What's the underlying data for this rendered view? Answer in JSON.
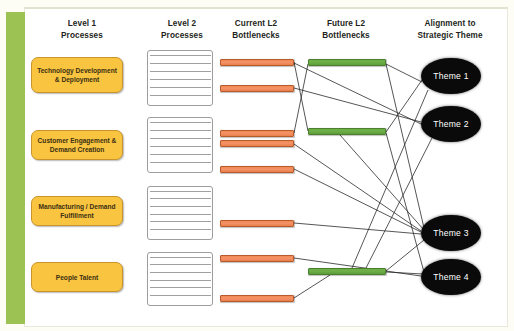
{
  "diagram": {
    "columns": [
      {
        "id": "level1",
        "line1": "Level 1",
        "line2": "Processes",
        "x": 82,
        "y": 18
      },
      {
        "id": "level2",
        "line1": "Level 2",
        "line2": "Processes",
        "x": 182,
        "y": 18
      },
      {
        "id": "current_l2_bottlenecks",
        "line1": "Current L2",
        "line2": "Bottlenecks",
        "x": 256,
        "y": 18
      },
      {
        "id": "future_l2_bottlenecks",
        "line1": "Future L2",
        "line2": "Bottlenecks",
        "x": 346,
        "y": 18
      },
      {
        "id": "alignment",
        "line1": "Alignment to",
        "line2": "Strategic Theme",
        "x": 450,
        "y": 18
      }
    ],
    "level1_processes": [
      {
        "id": "technology",
        "label": "Technology Development & Deployment",
        "x": 31,
        "y": 57,
        "w": 92,
        "h": 36
      },
      {
        "id": "customer",
        "label": "Customer Engagement & Demand Creation",
        "x": 31,
        "y": 130,
        "w": 92,
        "h": 30
      },
      {
        "id": "manufacturing",
        "label": "Manufacturing / Demand Fulfillment",
        "x": 31,
        "y": 196,
        "w": 92,
        "h": 30
      },
      {
        "id": "people",
        "label": "People Talent",
        "x": 31,
        "y": 262,
        "w": 92,
        "h": 30
      }
    ],
    "level2_stacks": [
      {
        "id": "stack-technology",
        "rows": 7,
        "x": 147,
        "y": 50,
        "w": 66,
        "h": 56
      },
      {
        "id": "stack-customer",
        "rows": 7,
        "x": 147,
        "y": 117,
        "w": 66,
        "h": 56
      },
      {
        "id": "stack-manufacturing",
        "rows": 7,
        "x": 147,
        "y": 186,
        "w": 66,
        "h": 54
      },
      {
        "id": "stack-people",
        "rows": 7,
        "x": 147,
        "y": 252,
        "w": 66,
        "h": 54
      }
    ],
    "current_bottlenecks": [
      {
        "id": "cb1",
        "x": 220,
        "y": 59,
        "w": 74
      },
      {
        "id": "cb2",
        "x": 220,
        "y": 85,
        "w": 74
      },
      {
        "id": "cb3",
        "x": 220,
        "y": 130,
        "w": 74
      },
      {
        "id": "cb4",
        "x": 220,
        "y": 140,
        "w": 74
      },
      {
        "id": "cb5",
        "x": 220,
        "y": 166,
        "w": 74
      },
      {
        "id": "cb6",
        "x": 220,
        "y": 220,
        "w": 74
      },
      {
        "id": "cb7",
        "x": 220,
        "y": 255,
        "w": 74
      },
      {
        "id": "cb8",
        "x": 220,
        "y": 295,
        "w": 74
      }
    ],
    "future_bottlenecks": [
      {
        "id": "fb1",
        "x": 308,
        "y": 59,
        "w": 78
      },
      {
        "id": "fb2",
        "x": 308,
        "y": 128,
        "w": 78
      },
      {
        "id": "fb3",
        "x": 308,
        "y": 268,
        "w": 78
      }
    ],
    "themes": [
      {
        "id": "theme1",
        "label": "Theme 1",
        "cx": 451,
        "cy": 76,
        "rx": 30,
        "ry": 18
      },
      {
        "id": "theme2",
        "label": "Theme 2",
        "cx": 451,
        "cy": 124,
        "rx": 30,
        "ry": 18
      },
      {
        "id": "theme3",
        "label": "Theme 3",
        "cx": 451,
        "cy": 233,
        "rx": 30,
        "ry": 18
      },
      {
        "id": "theme4",
        "label": "Theme 4",
        "cx": 451,
        "cy": 277,
        "rx": 30,
        "ry": 18
      }
    ],
    "connectors": [
      {
        "from": "cb1",
        "to": "fb2",
        "x1": 294,
        "y1": 62,
        "x2": 308,
        "y2": 131
      },
      {
        "from": "cb1",
        "to": "theme2",
        "x1": 294,
        "y1": 63,
        "x2": 421,
        "y2": 124
      },
      {
        "from": "cb2",
        "to": "theme2",
        "x1": 294,
        "y1": 88,
        "x2": 421,
        "y2": 122
      },
      {
        "from": "cb3",
        "to": "fb1",
        "x1": 294,
        "y1": 133,
        "x2": 308,
        "y2": 64
      },
      {
        "from": "cb4",
        "to": "theme3",
        "x1": 294,
        "y1": 144,
        "x2": 421,
        "y2": 231
      },
      {
        "from": "cb5",
        "to": "theme3",
        "x1": 294,
        "y1": 169,
        "x2": 421,
        "y2": 232
      },
      {
        "from": "cb6",
        "to": "theme3",
        "x1": 294,
        "y1": 223,
        "x2": 421,
        "y2": 234
      },
      {
        "from": "cb7",
        "to": "theme4",
        "x1": 294,
        "y1": 258,
        "x2": 421,
        "y2": 276
      },
      {
        "from": "cb8",
        "to": "fb3",
        "x1": 294,
        "y1": 298,
        "x2": 330,
        "y2": 275
      },
      {
        "from": "fb1",
        "to": "theme1",
        "x1": 386,
        "y1": 64,
        "x2": 422,
        "y2": 82
      },
      {
        "from": "fb1",
        "to": "theme3",
        "x1": 386,
        "y1": 64,
        "x2": 424,
        "y2": 228
      },
      {
        "from": "fb2",
        "to": "theme1",
        "x1": 386,
        "y1": 132,
        "x2": 422,
        "y2": 80
      },
      {
        "from": "fb2",
        "to": "theme4",
        "x1": 386,
        "y1": 133,
        "x2": 424,
        "y2": 272
      },
      {
        "from": "fb2",
        "to": "theme3",
        "x1": 340,
        "y1": 135,
        "x2": 424,
        "y2": 230
      },
      {
        "from": "fb3",
        "to": "theme1",
        "x1": 352,
        "y1": 268,
        "x2": 428,
        "y2": 90
      },
      {
        "from": "fb3",
        "to": "theme3",
        "x1": 386,
        "y1": 271,
        "x2": 424,
        "y2": 240
      },
      {
        "from": "fb3",
        "to": "theme2",
        "x1": 366,
        "y1": 268,
        "x2": 432,
        "y2": 138
      },
      {
        "from": "fb3",
        "to": "theme4",
        "x1": 386,
        "y1": 272,
        "x2": 423,
        "y2": 274
      }
    ],
    "colors": {
      "accent_green": "#9cc253",
      "box_yellow": "#f9c440",
      "bar_orange": "#ef8a55",
      "bar_green": "#69ab45",
      "oval_black": "#0a0a0a",
      "page_background": "#fdfdf6"
    }
  }
}
